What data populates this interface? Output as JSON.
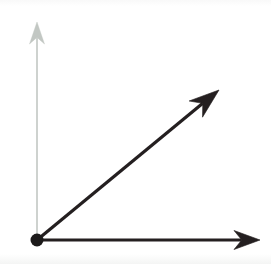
{
  "figure": {
    "background_color": "#ffffff",
    "width": 271,
    "height": 264
  },
  "colors": {
    "vector_black": "#241f20",
    "axis_gray": "#c2c7c3",
    "axis_gray_head": "#b4bab5",
    "origin_dot": "#1c1a1a",
    "background": "#ffffff"
  },
  "origin": {
    "label": "origin-point",
    "x": 37,
    "y": 240,
    "radius": 6.5,
    "color": "#1c1a1a"
  },
  "vectors": [
    {
      "name": "vertical-axis-arrow",
      "style": "gray-thin",
      "color": "#c2c7c3",
      "from_x": 37,
      "from_y": 240,
      "to_x": 37,
      "to_y": 22,
      "stroke_width": 1.6,
      "head_length": 22,
      "head_width": 15,
      "angle_deg": 90,
      "description": "light gray vertical reference axis pointing up"
    },
    {
      "name": "horizontal-axis-arrow",
      "style": "black-bold",
      "color": "#241f20",
      "from_x": 37,
      "from_y": 240,
      "to_x": 260,
      "to_y": 240,
      "stroke_width": 3.2,
      "head_length": 26,
      "head_width": 19,
      "angle_deg": 0,
      "description": "black horizontal vector pointing right"
    },
    {
      "name": "diagonal-vector-arrow",
      "style": "black-bold",
      "color": "#241f20",
      "from_x": 37,
      "from_y": 240,
      "to_x": 219,
      "to_y": 90,
      "stroke_width": 3.2,
      "head_length": 30,
      "head_width": 21,
      "angle_deg": 39.5,
      "description": "black diagonal vector pointing up and to the right at about 40 degrees"
    }
  ],
  "chart_data": {
    "type": "scatter",
    "xlabel": "",
    "ylabel": "",
    "xlim": [
      0,
      271
    ],
    "ylim": [
      0,
      264
    ],
    "grid": false,
    "legend": "none",
    "annotations": [
      "origin dot at (37, 240)",
      "gray vertical axis ray upward to (37, 22)",
      "black horizontal ray rightward to (260, 240)",
      "black diagonal ray to (219, 90), approximately 40 degrees above horizontal"
    ],
    "series": [
      {
        "name": "vertical-axis-arrow",
        "x": [
          37,
          37
        ],
        "y": [
          240,
          22
        ]
      },
      {
        "name": "horizontal-axis-arrow",
        "x": [
          37,
          260
        ],
        "y": [
          240,
          240
        ]
      },
      {
        "name": "diagonal-vector-arrow",
        "x": [
          37,
          219
        ],
        "y": [
          240,
          90
        ]
      }
    ]
  }
}
